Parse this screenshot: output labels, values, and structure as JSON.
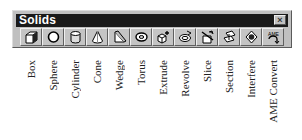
{
  "window": {
    "title": "Solids",
    "close_label": "×"
  },
  "toolbar": {
    "buttons": [
      {
        "label": "Box",
        "icon": "box-icon"
      },
      {
        "label": "Sphere",
        "icon": "sphere-icon"
      },
      {
        "label": "Cylinder",
        "icon": "cylinder-icon"
      },
      {
        "label": "Cone",
        "icon": "cone-icon"
      },
      {
        "label": "Wedge",
        "icon": "wedge-icon"
      },
      {
        "label": "Torus",
        "icon": "torus-icon"
      },
      {
        "label": "Extrude",
        "icon": "extrude-icon"
      },
      {
        "label": "Revolve",
        "icon": "revolve-icon"
      },
      {
        "label": "Slice",
        "icon": "slice-icon"
      },
      {
        "label": "Section",
        "icon": "section-icon"
      },
      {
        "label": "Interfere",
        "icon": "interfere-icon"
      },
      {
        "label": "AME Convert",
        "icon": "ame-convert-icon",
        "icon_text": "AME"
      }
    ]
  },
  "colors": {
    "titlebar": "#1a1a1a",
    "face": "#c0c0c0",
    "title_text": "#ffffff"
  }
}
